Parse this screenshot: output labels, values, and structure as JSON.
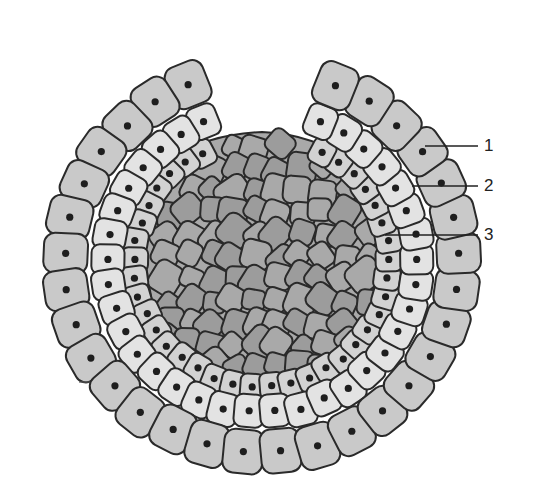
{
  "figure": {
    "type": "embryo-cross-section",
    "colors": {
      "background": "#ffffff",
      "outline": "#2a2a2a",
      "outer_layer_fill": "#c9c9c9",
      "middle_layer_fill": "#e3e3e3",
      "inner_layer_fill": "#d2d2d2",
      "core_fill": "#a9a9a9",
      "core_fill_dark": "#9c9c9c",
      "nucleus": "#1e1e1e"
    },
    "center": [
      262,
      262
    ],
    "layers": [
      {
        "id": "outer",
        "radius": 196,
        "cell_size": 40,
        "count": 30,
        "start_deg": 112,
        "end_deg": 428
      },
      {
        "id": "middle",
        "radius": 155,
        "cell_size": 30,
        "count": 34,
        "start_deg": 112,
        "end_deg": 428
      },
      {
        "id": "inner",
        "radius": 128,
        "cell_size": 24,
        "count": 36,
        "start_deg": 118,
        "end_deg": 422
      }
    ],
    "labels": [
      {
        "text": "1",
        "x": 484,
        "y": 151,
        "line": [
          425,
          146,
          478,
          146
        ]
      },
      {
        "text": "2",
        "x": 484,
        "y": 191,
        "line": [
          412,
          186,
          478,
          186
        ]
      },
      {
        "text": "3",
        "x": 484,
        "y": 240,
        "line": [
          385,
          235,
          478,
          235
        ]
      }
    ],
    "tick_mark": {
      "line": [
        79,
        382,
        90,
        382
      ]
    }
  }
}
